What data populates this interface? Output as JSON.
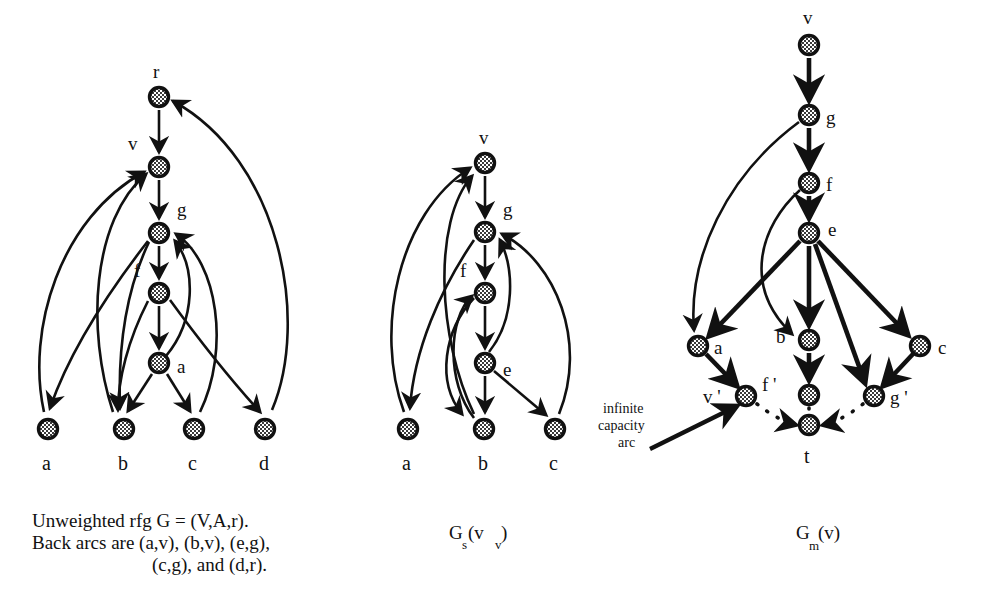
{
  "figure": {
    "background_color": "#ffffff",
    "ink_color": "#111111",
    "node_fill": "#9a9a9a"
  },
  "panels": [
    {
      "id": "left",
      "caption_lines": [
        "Unweighted rfg G = (V,A,r).",
        "Back arcs are (a,v), (b,v), (e,g),",
        "(c,g), and (d,r)."
      ],
      "caption_align": "left",
      "nodes": [
        {
          "key": "r",
          "label": "r",
          "label_pos": "top",
          "x": 159,
          "y": 97
        },
        {
          "key": "v",
          "label": "v",
          "label_pos": "top-left",
          "x": 159,
          "y": 167
        },
        {
          "key": "g",
          "label": "g",
          "label_pos": "top-right",
          "x": 159,
          "y": 233
        },
        {
          "key": "f",
          "label": "f",
          "label_pos": "top-left",
          "x": 159,
          "y": 293
        },
        {
          "key": "a2",
          "label": "a",
          "label_pos": "right",
          "x": 159,
          "y": 363
        },
        {
          "key": "la",
          "label": "a",
          "label_pos": "below",
          "x": 48,
          "y": 429
        },
        {
          "key": "lb",
          "label": "b",
          "label_pos": "below",
          "x": 124,
          "y": 429
        },
        {
          "key": "lc",
          "label": "c",
          "label_pos": "below",
          "x": 194,
          "y": 429
        },
        {
          "key": "ld",
          "label": "d",
          "label_pos": "below",
          "x": 265,
          "y": 429
        }
      ],
      "arcs": [
        {
          "from": "r",
          "to": "v",
          "kind": "tree"
        },
        {
          "from": "v",
          "to": "g",
          "kind": "tree"
        },
        {
          "from": "g",
          "to": "f",
          "kind": "tree"
        },
        {
          "from": "f",
          "to": "a2",
          "kind": "tree"
        },
        {
          "from": "g",
          "to": "lb",
          "kind": "tree"
        },
        {
          "from": "f",
          "to": "lb",
          "kind": "tree"
        },
        {
          "from": "a2",
          "to": "lb",
          "kind": "tree"
        },
        {
          "from": "a2",
          "to": "lc",
          "kind": "tree"
        },
        {
          "from": "g",
          "to": "ld",
          "kind": "tree"
        },
        {
          "from": "g",
          "to": "la",
          "kind": "tree"
        },
        {
          "from": "la",
          "to": "v",
          "kind": "back"
        },
        {
          "from": "lb",
          "to": "v",
          "kind": "back"
        },
        {
          "from": "a2",
          "to": "g",
          "kind": "back"
        },
        {
          "from": "lc",
          "to": "g",
          "kind": "back"
        },
        {
          "from": "ld",
          "to": "r",
          "kind": "back"
        }
      ]
    },
    {
      "id": "middle",
      "caption_main": "G",
      "caption_sub_1": "s",
      "caption_paren_open": " (v",
      "caption_sub_2": "v",
      "caption_paren_close": ")",
      "nodes": [
        {
          "key": "v",
          "label": "v",
          "label_pos": "top",
          "x": 485,
          "y": 163
        },
        {
          "key": "g",
          "label": "g",
          "label_pos": "top-right",
          "x": 485,
          "y": 232
        },
        {
          "key": "f",
          "label": "f",
          "label_pos": "top-left",
          "x": 485,
          "y": 293
        },
        {
          "key": "e",
          "label": "e",
          "label_pos": "right",
          "x": 485,
          "y": 363
        },
        {
          "key": "la",
          "label": "a",
          "label_pos": "below",
          "x": 408,
          "y": 429
        },
        {
          "key": "lb",
          "label": "b",
          "label_pos": "below",
          "x": 484,
          "y": 429
        },
        {
          "key": "lc",
          "label": "c",
          "label_pos": "below",
          "x": 555,
          "y": 429
        }
      ],
      "arcs": [
        {
          "from": "v",
          "to": "g",
          "kind": "tree"
        },
        {
          "from": "g",
          "to": "f",
          "kind": "tree"
        },
        {
          "from": "f",
          "to": "e",
          "kind": "tree"
        },
        {
          "from": "g",
          "to": "lb",
          "kind": "tree"
        },
        {
          "from": "f",
          "to": "lb",
          "kind": "tree"
        },
        {
          "from": "e",
          "to": "lc",
          "kind": "tree"
        },
        {
          "from": "g",
          "to": "la",
          "kind": "tree"
        },
        {
          "from": "la",
          "to": "v",
          "kind": "back"
        },
        {
          "from": "lb",
          "to": "v",
          "kind": "back"
        },
        {
          "from": "e",
          "to": "g",
          "kind": "back"
        },
        {
          "from": "lc",
          "to": "g",
          "kind": "back"
        },
        {
          "from": "lb",
          "to": "f",
          "kind": "back"
        }
      ]
    },
    {
      "id": "right",
      "caption_main": "G",
      "caption_sub_1": "m",
      "caption_paren_open": " (v)",
      "annotation": {
        "lines": [
          "infinite",
          "capacity",
          "arc"
        ]
      },
      "nodes": [
        {
          "key": "v",
          "label": "v",
          "label_pos": "top",
          "x": 809,
          "y": 45
        },
        {
          "key": "g",
          "label": "g",
          "label_pos": "right",
          "x": 809,
          "y": 115
        },
        {
          "key": "f",
          "label": "f",
          "label_pos": "right",
          "x": 809,
          "y": 183
        },
        {
          "key": "e",
          "label": "e",
          "label_pos": "right",
          "x": 809,
          "y": 233
        },
        {
          "key": "b",
          "label": "b",
          "label_pos": "left",
          "x": 809,
          "y": 340
        },
        {
          "key": "fp",
          "label": "f '",
          "label_pos": "left",
          "x": 809,
          "y": 395
        },
        {
          "key": "t",
          "label": "t",
          "label_pos": "below",
          "x": 809,
          "y": 425
        },
        {
          "key": "a",
          "label": "a",
          "label_pos": "right",
          "x": 698,
          "y": 346
        },
        {
          "key": "vp",
          "label": "v '",
          "label_pos": "left",
          "x": 746,
          "y": 396
        },
        {
          "key": "c",
          "label": "c",
          "label_pos": "right",
          "x": 920,
          "y": 346
        },
        {
          "key": "gp",
          "label": "g '",
          "label_pos": "right",
          "x": 874,
          "y": 396
        }
      ],
      "arcs": [
        {
          "from": "v",
          "to": "g",
          "kind": "tree"
        },
        {
          "from": "g",
          "to": "f",
          "kind": "tree"
        },
        {
          "from": "f",
          "to": "e",
          "kind": "tree"
        },
        {
          "from": "g",
          "to": "a",
          "kind": "curve"
        },
        {
          "from": "e",
          "to": "a",
          "kind": "tree"
        },
        {
          "from": "f",
          "to": "b",
          "kind": "curve"
        },
        {
          "from": "e",
          "to": "b",
          "kind": "tree"
        },
        {
          "from": "e",
          "to": "c",
          "kind": "tree"
        },
        {
          "from": "e",
          "to": "gp",
          "kind": "tree"
        },
        {
          "from": "a",
          "to": "vp",
          "kind": "tree"
        },
        {
          "from": "b",
          "to": "fp",
          "kind": "tree"
        },
        {
          "from": "c",
          "to": "gp",
          "kind": "tree"
        },
        {
          "from": "vp",
          "to": "t",
          "kind": "dotted"
        },
        {
          "from": "fp",
          "to": "t",
          "kind": "dotted"
        },
        {
          "from": "gp",
          "to": "t",
          "kind": "dotted"
        }
      ]
    }
  ]
}
